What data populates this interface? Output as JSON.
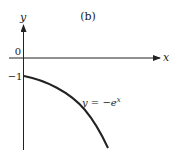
{
  "figure": {
    "panel_label": "(b)",
    "x_axis_label": "x",
    "y_axis_label": "y",
    "origin_label": "0",
    "y_tick_label": "−1",
    "curve_label": "y = −e",
    "curve_label_exponent": "x",
    "colors": {
      "ink": "#222222",
      "background": "#ffffff"
    }
  }
}
